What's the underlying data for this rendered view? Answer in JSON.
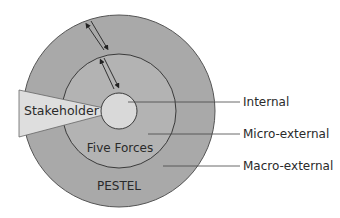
{
  "diagram": {
    "rings": {
      "outer_label": "PESTEL",
      "middle_label": "Five Forces",
      "wedge_label": "Stakeholder"
    },
    "callouts": [
      {
        "label": "Internal"
      },
      {
        "label": "Micro-external"
      },
      {
        "label": "Macro-external"
      }
    ],
    "colors": {
      "outer_ring": "#a9a9a9",
      "middle_ring": "#b3b3b3",
      "inner_circle": "#d9d9d9",
      "wedge": "#dedede",
      "stroke": "#3a3a3a",
      "text": "#2a2a2a"
    }
  }
}
